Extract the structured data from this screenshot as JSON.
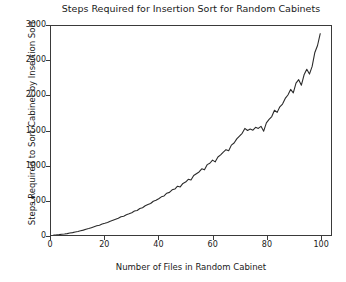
{
  "chart_data": {
    "type": "line",
    "title": "Steps Required for Insertion Sort for Random Cabinets",
    "xlabel": "Number of Files in Random Cabinet",
    "ylabel": "Steps Required to Sort Cabinet by Insertion Sort",
    "xlim": [
      0,
      104
    ],
    "ylim": [
      0,
      3000
    ],
    "xticks": [
      0,
      20,
      40,
      60,
      80,
      100
    ],
    "xtick_labels": [
      "0",
      "20",
      "40",
      "60",
      "80",
      "100"
    ],
    "yticks": [
      0,
      500,
      1000,
      1500,
      2000,
      2500,
      3000
    ],
    "ytick_labels": [
      "0",
      "500",
      "1000",
      "1500",
      "2000",
      "2500",
      "3000"
    ],
    "grid": false,
    "legend": null,
    "line_color": "#2b2b2b",
    "line_width": 1.1,
    "background_color": "#ffffff",
    "series": [
      {
        "name": "insertion sort steps",
        "x": [
          1,
          2,
          3,
          4,
          5,
          6,
          7,
          8,
          9,
          10,
          11,
          12,
          13,
          14,
          15,
          16,
          17,
          18,
          19,
          20,
          21,
          22,
          23,
          24,
          25,
          26,
          27,
          28,
          29,
          30,
          31,
          32,
          33,
          34,
          35,
          36,
          37,
          38,
          39,
          40,
          41,
          42,
          43,
          44,
          45,
          46,
          47,
          48,
          49,
          50,
          51,
          52,
          53,
          54,
          55,
          56,
          57,
          58,
          59,
          60,
          61,
          62,
          63,
          64,
          65,
          66,
          67,
          68,
          69,
          70,
          71,
          72,
          73,
          74,
          75,
          76,
          77,
          78,
          79,
          80,
          81,
          82,
          83,
          84,
          85,
          86,
          87,
          88,
          89,
          90,
          91,
          92,
          93,
          94,
          95,
          96,
          97,
          98,
          99,
          100
        ],
        "values": [
          0,
          2,
          5,
          10,
          14,
          20,
          28,
          34,
          42,
          50,
          60,
          70,
          82,
          92,
          105,
          118,
          132,
          140,
          158,
          168,
          180,
          198,
          212,
          226,
          240,
          262,
          270,
          292,
          305,
          320,
          345,
          352,
          380,
          392,
          420,
          438,
          452,
          485,
          498,
          520,
          548,
          560,
          600,
          612,
          648,
          660,
          700,
          690,
          740,
          760,
          800,
          790,
          855,
          880,
          905,
          950,
          935,
          1010,
          1030,
          1075,
          1050,
          1120,
          1150,
          1190,
          1225,
          1210,
          1290,
          1320,
          1380,
          1420,
          1460,
          1530,
          1500,
          1520,
          1505,
          1545,
          1530,
          1560,
          1490,
          1610,
          1660,
          1700,
          1790,
          1760,
          1840,
          1880,
          1960,
          2010,
          2090,
          2040,
          2180,
          2230,
          2150,
          2300,
          2380,
          2310,
          2420,
          2620,
          2720,
          2890
        ]
      }
    ]
  }
}
